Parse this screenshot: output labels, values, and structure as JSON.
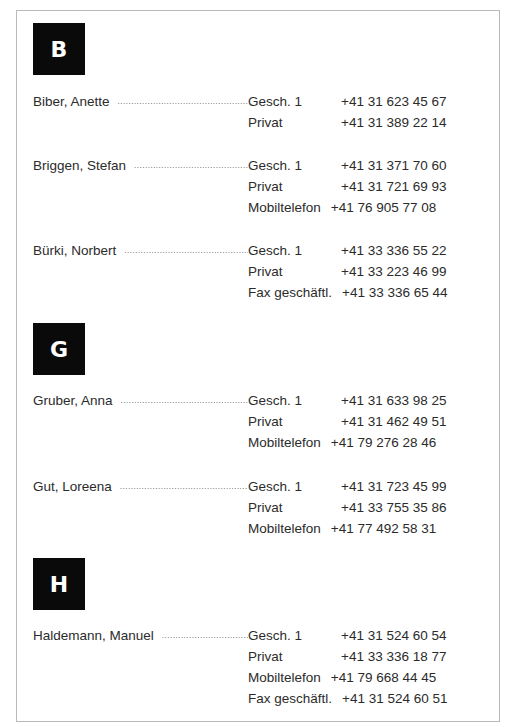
{
  "directory": {
    "sections": [
      {
        "letter": "B",
        "entries": [
          {
            "name": "Biber, Anette",
            "phones": [
              {
                "label": "Gesch. 1",
                "value": "+41 31 623 45 67"
              },
              {
                "label": "Privat",
                "value": "+41 31 389 22 14"
              }
            ]
          },
          {
            "name": "Briggen, Stefan",
            "phones": [
              {
                "label": "Gesch. 1",
                "value": "+41 31 371 70 60"
              },
              {
                "label": "Privat",
                "value": "+41 31 721 69 93"
              },
              {
                "label": "Mobiltelefon",
                "value": "+41 76 905 77 08"
              }
            ]
          },
          {
            "name": "Bürki, Norbert",
            "phones": [
              {
                "label": "Gesch. 1",
                "value": "+41 33 336 55 22"
              },
              {
                "label": "Privat",
                "value": "+41 33 223 46 99"
              },
              {
                "label": "Fax geschäftl.",
                "value": "+41 33 336 65 44"
              }
            ]
          }
        ]
      },
      {
        "letter": "G",
        "entries": [
          {
            "name": "Gruber, Anna",
            "phones": [
              {
                "label": "Gesch. 1",
                "value": "+41 31 633 98 25"
              },
              {
                "label": "Privat",
                "value": "+41 31 462 49 51"
              },
              {
                "label": "Mobiltelefon",
                "value": "+41 79 276 28 46"
              }
            ]
          },
          {
            "name": "Gut, Loreena",
            "phones": [
              {
                "label": "Gesch. 1",
                "value": "+41 31 723 45 99"
              },
              {
                "label": "Privat",
                "value": "+41 33 755 35 86"
              },
              {
                "label": "Mobiltelefon",
                "value": "+41 77 492 58 31"
              }
            ]
          }
        ]
      },
      {
        "letter": "H",
        "entries": [
          {
            "name": "Haldemann, Manuel",
            "phones": [
              {
                "label": "Gesch. 1",
                "value": "+41 31 524 60 54"
              },
              {
                "label": "Privat",
                "value": "+41 33 336 18 77"
              },
              {
                "label": "Mobiltelefon",
                "value": "+41 79 668 44 45"
              },
              {
                "label": "Fax geschäftl.",
                "value": "+41 31 524 60 51"
              }
            ]
          }
        ]
      }
    ],
    "leader_char": "................................................................................................"
  }
}
